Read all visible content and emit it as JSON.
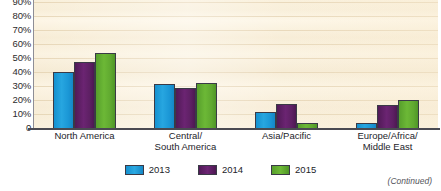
{
  "chart_data": {
    "type": "bar",
    "title": "",
    "xlabel": "",
    "ylabel": "",
    "ylim": [
      0,
      90
    ],
    "grid": true,
    "legend_position": "bottom-center",
    "ytick_labels": [
      "90%",
      "80%",
      "70%",
      "60%",
      "50%",
      "40%",
      "30%",
      "20%",
      "10%",
      "0"
    ],
    "ytick_values": [
      90,
      80,
      70,
      60,
      50,
      40,
      30,
      20,
      10,
      0
    ],
    "categories": [
      "North America",
      "Central/ South America",
      "Asia/Pacific",
      "Europe/Africa/ Middle East"
    ],
    "category_lines": [
      [
        "North America"
      ],
      [
        "Central/",
        "South America"
      ],
      [
        "Asia/Pacific"
      ],
      [
        "Europe/Africa/",
        "Middle East"
      ]
    ],
    "series": [
      {
        "name": "2013",
        "color": "#1B9BD8",
        "values": [
          41,
          32,
          12,
          4
        ]
      },
      {
        "name": "2014",
        "color": "#5B2060",
        "values": [
          48,
          29,
          18,
          17
        ]
      },
      {
        "name": "2015",
        "color": "#5FA830",
        "values": [
          54,
          33,
          4,
          21
        ]
      }
    ]
  },
  "legend": {
    "items": [
      {
        "label": "2013"
      },
      {
        "label": "2014"
      },
      {
        "label": "2015"
      }
    ]
  },
  "footer": {
    "continued_note": "(Continued)"
  },
  "colors": {
    "series_2013": "#1B9BD8",
    "series_2014": "#5B2060",
    "series_2015": "#5FA830",
    "plot_background": "#FAF0DC",
    "gridline": "#E2CFAC",
    "axis": "#4A4A52",
    "text": "#23242A"
  }
}
